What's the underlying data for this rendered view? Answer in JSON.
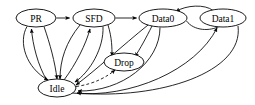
{
  "diagram": {
    "type": "directed-graph",
    "background_color": "#ffffff",
    "stroke_color": "#000000",
    "node_shape": "ellipse",
    "nodes": [
      {
        "id": "PR",
        "label": "PR",
        "cx": 36,
        "cy": 18,
        "rx": 20,
        "ry": 9
      },
      {
        "id": "SFD",
        "label": "SFD",
        "cx": 94,
        "cy": 18,
        "rx": 21,
        "ry": 9
      },
      {
        "id": "Data0",
        "label": "Data0",
        "cx": 163,
        "cy": 18,
        "rx": 24,
        "ry": 9
      },
      {
        "id": "Data1",
        "label": "Data1",
        "cx": 223,
        "cy": 18,
        "rx": 23,
        "ry": 9
      },
      {
        "id": "Drop",
        "label": "Drop",
        "cx": 124,
        "cy": 62,
        "rx": 20,
        "ry": 9
      },
      {
        "id": "Idle",
        "label": "Idle",
        "cx": 57,
        "cy": 88,
        "rx": 19,
        "ry": 9
      }
    ],
    "edges": [
      {
        "from": "PR",
        "to": "SFD",
        "style": "solid"
      },
      {
        "from": "SFD",
        "to": "Data0",
        "style": "solid"
      },
      {
        "from": "Data1",
        "to": "Data0",
        "style": "solid"
      },
      {
        "from": "Idle",
        "to": "PR",
        "style": "solid"
      },
      {
        "from": "PR",
        "to": "Idle",
        "style": "solid"
      },
      {
        "from": "Idle",
        "to": "SFD",
        "style": "solid"
      },
      {
        "from": "SFD",
        "to": "Idle",
        "style": "solid"
      },
      {
        "from": "SFD",
        "to": "Drop",
        "style": "solid"
      },
      {
        "from": "Data0",
        "to": "Drop",
        "style": "solid"
      },
      {
        "from": "Drop",
        "to": "Idle",
        "style": "dashed"
      },
      {
        "from": "Data0",
        "to": "Idle",
        "style": "solid"
      },
      {
        "from": "Data0",
        "to": "Idle",
        "style": "solid"
      },
      {
        "from": "Idle",
        "to": "Data1",
        "style": "solid"
      },
      {
        "from": "Data1",
        "to": "Idle",
        "style": "solid"
      }
    ]
  }
}
